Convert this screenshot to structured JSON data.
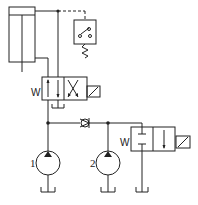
{
  "diagram": {
    "type": "hydraulic-schematic",
    "components": {
      "cylinder": {
        "name": "single-rod cylinder"
      },
      "pressure_switch": {
        "name": "pressure switch"
      },
      "valve_top": {
        "name": "2-position solenoid directional valve",
        "spring_label": "W"
      },
      "check_valve": {
        "name": "check valve"
      },
      "valve_right": {
        "name": "2-position solenoid unloading valve",
        "spring_label": "W"
      },
      "pump_1": {
        "name": "pump",
        "label": "1"
      },
      "pump_2": {
        "name": "pump",
        "label": "2"
      },
      "tanks": {
        "count": 4
      }
    },
    "colors": {
      "line": "#222222",
      "background": "#ffffff"
    }
  }
}
